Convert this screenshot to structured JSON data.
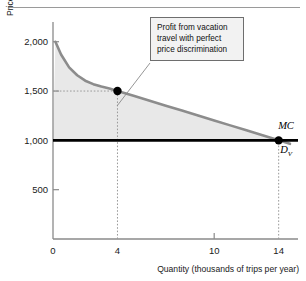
{
  "figure": {
    "name": "vacation-travel-price-discrimination-figure",
    "has_top_rule": true
  },
  "colors": {
    "demand_curve": "#8c8c8c",
    "mc_line": "#000000",
    "shaded_area": "#e8e8e8",
    "axis": "#8a8a8a",
    "text": "#1a1a1a",
    "callout_bg": "#f2f2f2",
    "callout_border": "#6e6e6e",
    "dot": "#000000",
    "dotted_guide": "#9a9a9a"
  },
  "annotation": {
    "text": "Profit from vacation\ntravel with perfect\nprice discrimination",
    "line_from": [
      150,
      63
    ],
    "line_to": [
      117,
      106
    ]
  },
  "chart_data": {
    "type": "line",
    "title": "",
    "subtitle": "",
    "xlabel": "Quantity (thousands of trips per year)",
    "ylabel": "Price (dollars per trip)",
    "xlim": [
      0,
      15.2
    ],
    "ylim": [
      0,
      2200
    ],
    "xticks": [
      0,
      4,
      10,
      14
    ],
    "xtick_labels": [
      "0",
      "4",
      "10",
      "14"
    ],
    "yticks": [
      500,
      1000,
      1500,
      2000
    ],
    "ytick_labels": [
      "500",
      "1,000",
      "1,500",
      "2,000"
    ],
    "grid": false,
    "legend": "inline-curve-labels",
    "series": [
      {
        "name": "D_V",
        "label": "D",
        "label_sub": "V",
        "type": "demand-curve",
        "description": "Vacation travel demand curve, convex decreasing",
        "points": [
          [
            0.15,
            2000
          ],
          [
            0.5,
            1870
          ],
          [
            1.0,
            1740
          ],
          [
            1.5,
            1660
          ],
          [
            2.0,
            1605
          ],
          [
            2.5,
            1570
          ],
          [
            3.0,
            1545
          ],
          [
            3.5,
            1525
          ],
          [
            4.0,
            1500
          ],
          [
            5.0,
            1452
          ],
          [
            6.0,
            1402
          ],
          [
            7.0,
            1352
          ],
          [
            8.0,
            1302
          ],
          [
            9.0,
            1252
          ],
          [
            10.0,
            1202
          ],
          [
            11.0,
            1152
          ],
          [
            12.0,
            1102
          ],
          [
            13.0,
            1052
          ],
          [
            14.0,
            1000
          ],
          [
            14.7,
            965
          ]
        ]
      },
      {
        "name": "MC",
        "label": "MC",
        "type": "marginal-cost-line",
        "description": "Horizontal marginal cost line at 1,000",
        "value": 1000,
        "x_from": 0,
        "x_to": 15.2
      }
    ],
    "markers": [
      {
        "name": "point-at-q4",
        "x": 4,
        "y": 1500
      },
      {
        "name": "point-at-q14",
        "x": 14,
        "y": 1000
      }
    ],
    "guides": [
      {
        "name": "guide-horizontal-1500",
        "orientation": "horizontal",
        "value": 1500,
        "from_x": 0,
        "to_x": 4
      },
      {
        "name": "guide-vertical-q4",
        "orientation": "vertical",
        "value": 4,
        "from_y": 0,
        "to_y": 1500
      },
      {
        "name": "guide-vertical-q14",
        "orientation": "vertical",
        "value": 14,
        "from_y": 0,
        "to_y": 1000
      }
    ],
    "shaded_regions": [
      {
        "name": "producer-surplus-area",
        "description": "Area between demand curve and MC line from Q=0 to Q=14",
        "upper": "D_V",
        "lower": "MC",
        "x_from": 0,
        "x_to": 14
      }
    ]
  }
}
